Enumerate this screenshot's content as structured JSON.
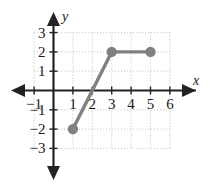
{
  "figure": {
    "title": "",
    "background_color": "#ffffff",
    "axis_color": "#222222",
    "grid_color": "#b9b9b9",
    "curve_color": "#808080",
    "label_color": "#1a1a1a"
  },
  "axes": {
    "x_name": "x",
    "y_name": "y",
    "x_ticks": [
      {
        "value": -1,
        "label": "−1"
      },
      {
        "value": 1,
        "label": "1"
      },
      {
        "value": 2,
        "label": "2"
      },
      {
        "value": 3,
        "label": "3"
      },
      {
        "value": 4,
        "label": "4"
      },
      {
        "value": 5,
        "label": "5"
      },
      {
        "value": 6,
        "label": "6"
      }
    ],
    "y_ticks": [
      {
        "value": 3,
        "label": "3"
      },
      {
        "value": 2,
        "label": "2"
      },
      {
        "value": 1,
        "label": "1"
      },
      {
        "value": -1,
        "label": "−1"
      },
      {
        "value": -2,
        "label": "−2"
      },
      {
        "value": -3,
        "label": "−3"
      }
    ]
  },
  "chart_data": {
    "type": "line",
    "title": "",
    "xlabel": "x",
    "ylabel": "y",
    "xlim": [
      -1.6,
      6.6
    ],
    "ylim": [
      -3.6,
      3.6
    ],
    "xticks": [
      -1,
      1,
      2,
      3,
      4,
      5,
      6
    ],
    "yticks": [
      -3,
      -2,
      -1,
      1,
      2,
      3
    ],
    "grid": true,
    "grid_style": "dotted",
    "legend": "none",
    "series": [
      {
        "name": "piecewise-linear graph",
        "color": "#808080",
        "x": [
          1,
          3,
          5
        ],
        "y": [
          -2,
          2,
          2
        ],
        "markers": [
          {
            "x": 1,
            "y": -2,
            "style": "filled"
          },
          {
            "x": 3,
            "y": 2,
            "style": "filled"
          },
          {
            "x": 5,
            "y": 2,
            "style": "filled"
          }
        ]
      }
    ],
    "annotations": []
  }
}
